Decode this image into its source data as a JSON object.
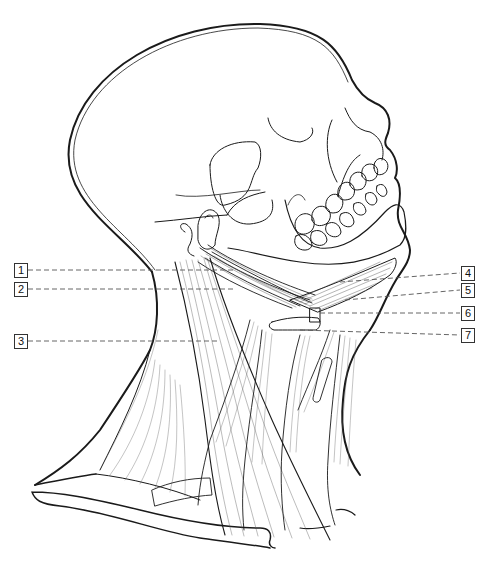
{
  "figure": {
    "caption_fragment": "————— ———— —————— ———————— —————— ———",
    "stroke_color": "#1a1a1a",
    "leader_color": "#555555",
    "background": "#ffffff"
  },
  "labels": [
    {
      "id": "1",
      "text": "1",
      "side": "left",
      "box_x": 14,
      "box_y": 263,
      "line_y": 270,
      "line_end_x": 235
    },
    {
      "id": "2",
      "text": "2",
      "side": "left",
      "box_x": 14,
      "box_y": 282,
      "line_y": 289,
      "line_end_x": 235
    },
    {
      "id": "3",
      "text": "3",
      "side": "left",
      "box_x": 14,
      "box_y": 334,
      "line_y": 341,
      "line_end_x": 218
    },
    {
      "id": "4",
      "text": "4",
      "side": "right",
      "box_x": 461,
      "box_y": 266,
      "line_y": 273,
      "line_start_x": 340,
      "line_start_y": 282
    },
    {
      "id": "5",
      "text": "5",
      "side": "right",
      "box_x": 461,
      "box_y": 283,
      "line_y": 290,
      "line_start_x": 345,
      "line_start_y": 300
    },
    {
      "id": "6",
      "text": "6",
      "side": "right",
      "box_x": 461,
      "box_y": 306,
      "line_y": 313,
      "line_start_x": 320,
      "line_start_y": 313
    },
    {
      "id": "7",
      "text": "7",
      "side": "right",
      "box_x": 461,
      "box_y": 328,
      "line_y": 335,
      "line_start_x": 300,
      "line_start_y": 330
    }
  ]
}
